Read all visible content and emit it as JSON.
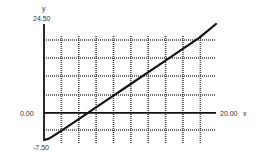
{
  "chart_data": {
    "type": "line",
    "title": "",
    "xlabel": "x",
    "ylabel": "y",
    "xlim": [
      0,
      20.0
    ],
    "ylim": [
      -7.5,
      24.5
    ],
    "grid": true,
    "grid_style": "dotted",
    "tick_labels": {
      "y_top": "24.50",
      "y_zero": "0.00",
      "y_bottom": "-7.50",
      "x_right": "20.00"
    },
    "series": [
      {
        "name": "y",
        "x": [
          0.0,
          0.5,
          1.0,
          2.0,
          4.0,
          6.0,
          8.0,
          10.0,
          12.0,
          14.0,
          16.0,
          18.0,
          20.0
        ],
        "y": [
          -7.5,
          -7.2,
          -6.5,
          -5.0,
          -1.8,
          1.4,
          4.6,
          7.8,
          11.0,
          14.2,
          17.4,
          20.6,
          24.5
        ]
      }
    ],
    "line_color": "#111111"
  }
}
